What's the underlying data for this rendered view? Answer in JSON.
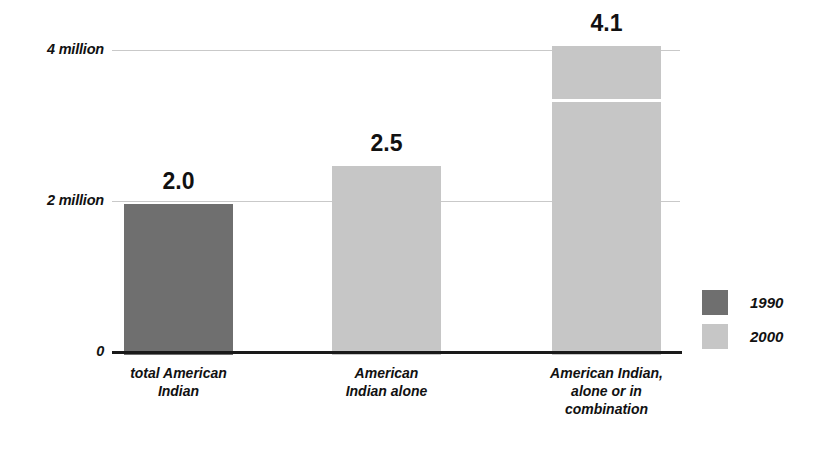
{
  "chart_data": {
    "type": "bar",
    "title": "",
    "subtitle": "",
    "xlabel": "",
    "ylabel": "",
    "categories": [
      "total American\nIndian",
      "American\nIndian alone",
      "American Indian,\nalone or in\ncombination"
    ],
    "category_lines": [
      [
        "total American",
        "Indian"
      ],
      [
        "American",
        "Indian alone"
      ],
      [
        "American Indian,",
        "alone or in",
        "combination"
      ]
    ],
    "values": [
      2.0,
      2.5,
      4.1
    ],
    "data_labels": [
      "2.0",
      "2.5",
      "4.1"
    ],
    "series": [
      {
        "name": "1990",
        "color": "#6f6f6f",
        "values": [
          2.0,
          null,
          null
        ]
      },
      {
        "name": "2000",
        "color": "#c6c6c6",
        "values": [
          null,
          2.5,
          4.1
        ]
      }
    ],
    "bar_series_index": [
      0,
      1,
      1
    ],
    "ylim": [
      0,
      4.4
    ],
    "yticks": [
      0,
      2,
      4
    ],
    "ytick_labels": [
      "0",
      "2 million",
      "4 million"
    ],
    "grid": true,
    "gridlines_at": [
      2,
      4
    ],
    "legend_position": "right",
    "legend": [
      {
        "label": "1990",
        "color": "#6f6f6f"
      },
      {
        "label": "2000",
        "color": "#c6c6c6"
      }
    ],
    "annotations": [
      {
        "type": "white-divider",
        "bar_index": 2,
        "value": 3.35,
        "note": "white horizontal rule inside third bar"
      }
    ],
    "units": "millions of people",
    "background_color": "#ffffff",
    "axis_color": "#1a1a1a",
    "gridline_color": "#c9c9c9"
  }
}
